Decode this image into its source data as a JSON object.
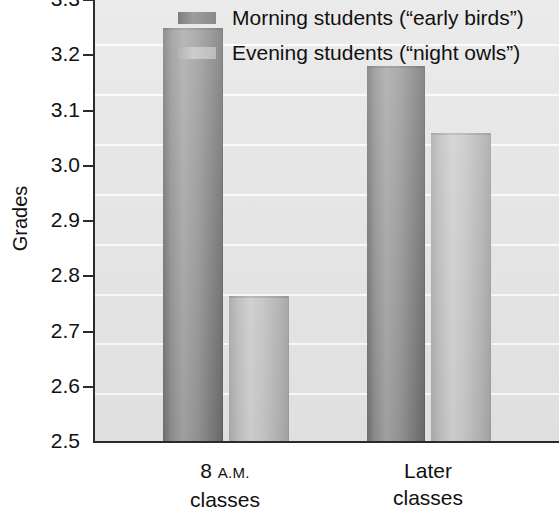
{
  "chart_data": {
    "type": "bar",
    "title": "",
    "xlabel": "",
    "ylabel": "Grades",
    "ylim": [
      2.5,
      3.3
    ],
    "ytick_step": 0.1,
    "grid": true,
    "grid_axis": "y",
    "legend_position": "top-right-inside",
    "categories": [
      "8 A.M. classes",
      "Later classes"
    ],
    "category_lines": [
      {
        "line1_number": "8",
        "line1_smallcaps": "A.M.",
        "line2": "classes"
      },
      {
        "line1_number": "Later",
        "line1_smallcaps": "",
        "line2": "classes"
      }
    ],
    "ytick_labels": [
      "3.3",
      "3.2",
      "3.1",
      "3.0",
      "2.9",
      "2.8",
      "2.7",
      "2.6",
      "2.5"
    ],
    "ytick_values": [
      3.3,
      3.2,
      3.1,
      3.0,
      2.9,
      2.8,
      2.7,
      2.6,
      2.5
    ],
    "series": [
      {
        "name": "Morning students (“early birds”)",
        "color": "#8d8d8d",
        "values": [
          3.25,
          3.18
        ]
      },
      {
        "name": "Evening students (“night owls”)",
        "color": "#c4c4c4",
        "values": [
          2.765,
          3.06
        ]
      }
    ]
  },
  "legend": {
    "items": [
      {
        "label": "Morning students (“early birds”)",
        "swatch": "dark-gray-swatch"
      },
      {
        "label": "Evening students (“night owls”)",
        "swatch": "light-gray-swatch"
      }
    ]
  },
  "axes": {
    "y_title": "Grades"
  },
  "colors": {
    "plot_background": "#e4e4e4",
    "gridline": "#fbfbfb",
    "axis": "#2b2b2b",
    "bar_morning": "#8d8d8d",
    "bar_evening": "#c4c4c4",
    "text": "#111111"
  }
}
